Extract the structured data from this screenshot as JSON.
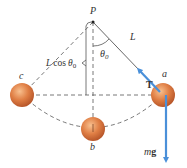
{
  "diagram": {
    "labels": {
      "pivot": "P",
      "length": "L",
      "angle": "θ",
      "angle_sub": "0",
      "lcos_L": "L",
      "lcos_cos": "cos",
      "lcos_theta": "θ",
      "lcos_sub": "0",
      "tension": "T",
      "weight_m": "m",
      "weight_g": "g",
      "pos_a": "a",
      "pos_b": "b",
      "pos_c": "c"
    },
    "colors": {
      "ball": "#d9733a",
      "ball_highlight": "#f6b27e",
      "arrow": "#4a90d9",
      "line": "#555555"
    }
  }
}
